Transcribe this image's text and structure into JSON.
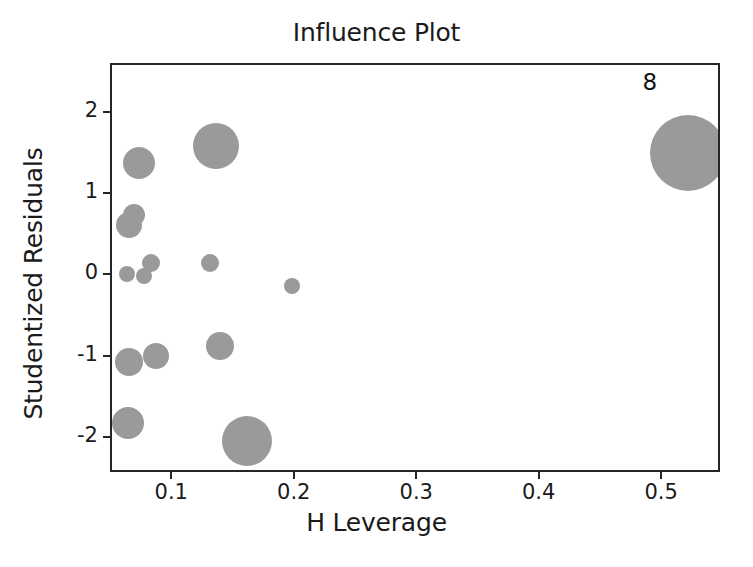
{
  "chart_data": {
    "type": "scatter",
    "title": "Influence Plot",
    "xlabel": "H Leverage",
    "ylabel": "Studentized Residuals",
    "xlim": [
      0.05,
      0.548
    ],
    "ylim": [
      -2.43,
      2.6
    ],
    "xticks": [
      0.1,
      0.2,
      0.3,
      0.4,
      0.5
    ],
    "xticklabels": [
      "0.1",
      "0.2",
      "0.3",
      "0.4",
      "0.5"
    ],
    "yticks": [
      2,
      1,
      0,
      -1,
      -2
    ],
    "yticklabels": [
      "2",
      "1",
      "0",
      "-1",
      "-2"
    ],
    "grid": false,
    "legend": null,
    "marker_color": "#9a9a9a",
    "frame_color": "#262626",
    "size_encodes": "Cook's distance (bubble area)",
    "points": [
      {
        "x": 0.52,
        "y": 1.52,
        "r": 38,
        "label": "8"
      },
      {
        "x": 0.135,
        "y": 1.6,
        "r": 23,
        "label": ""
      },
      {
        "x": 0.072,
        "y": 1.4,
        "r": 16,
        "label": ""
      },
      {
        "x": 0.068,
        "y": 0.76,
        "r": 11,
        "label": ""
      },
      {
        "x": 0.064,
        "y": 0.63,
        "r": 13,
        "label": ""
      },
      {
        "x": 0.082,
        "y": 0.17,
        "r": 9,
        "label": ""
      },
      {
        "x": 0.13,
        "y": 0.16,
        "r": 9,
        "label": ""
      },
      {
        "x": 0.062,
        "y": 0.03,
        "r": 8,
        "label": ""
      },
      {
        "x": 0.076,
        "y": 0.0,
        "r": 8,
        "label": ""
      },
      {
        "x": 0.197,
        "y": -0.12,
        "r": 8,
        "label": ""
      },
      {
        "x": 0.138,
        "y": -0.85,
        "r": 14,
        "label": ""
      },
      {
        "x": 0.064,
        "y": -1.05,
        "r": 14,
        "label": ""
      },
      {
        "x": 0.086,
        "y": -0.98,
        "r": 13,
        "label": ""
      },
      {
        "x": 0.063,
        "y": -1.8,
        "r": 16,
        "label": ""
      },
      {
        "x": 0.16,
        "y": -2.02,
        "r": 25,
        "label": ""
      }
    ],
    "annotations": [
      {
        "text": "8",
        "x": 0.483,
        "y": 2.38
      }
    ]
  }
}
